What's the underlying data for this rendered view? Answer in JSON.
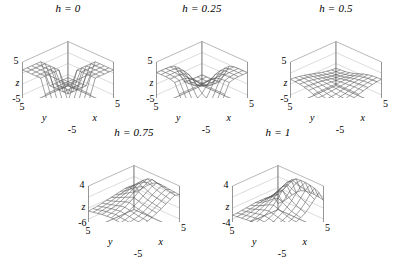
{
  "figure": {
    "type": "multi-panel-3d-surface-grid",
    "layout": "3 panels top row, 2 panels bottom row centered",
    "background_color": "#ffffff",
    "line_color": "#555555",
    "axis_color": "#888888",
    "text_color": "#000000"
  },
  "chart_data": [
    {
      "type": "line",
      "panel_id": "panel-h-0",
      "title": "h = 0",
      "title_parameter": "h",
      "title_value": "0",
      "xlabel": "x",
      "ylabel": "y",
      "zlabel": "z",
      "xlim": [
        -5,
        5
      ],
      "ylim": [
        -5,
        5
      ],
      "zlim": [
        -5,
        5
      ],
      "xticks": [
        "-5",
        "5"
      ],
      "yticks": [
        "-5",
        "5"
      ],
      "zticks": [
        "-5",
        "5"
      ],
      "grid": true,
      "legend": "none",
      "surface_description": "Sharp step discontinuity: two flat plateaus joined by vertical walls forming a cross-shaped jump at x=0 and y=0",
      "mesh_nx": 11,
      "mesh_ny": 11,
      "z_values": [
        [
          -3.2,
          -3.2,
          -3.2,
          -3.2,
          -3.2,
          0.0,
          3.2,
          3.2,
          3.2,
          3.2,
          3.2
        ],
        [
          -3.2,
          -3.2,
          -3.2,
          -3.2,
          -3.2,
          0.0,
          3.2,
          3.2,
          3.2,
          3.2,
          3.2
        ],
        [
          -3.2,
          -3.2,
          -3.2,
          -3.2,
          -3.2,
          0.0,
          3.2,
          3.2,
          3.2,
          3.2,
          3.2
        ],
        [
          -3.2,
          -3.2,
          -3.2,
          -3.2,
          -3.2,
          0.0,
          3.2,
          3.2,
          3.2,
          3.2,
          3.2
        ],
        [
          -3.2,
          -3.2,
          -3.2,
          -3.2,
          -3.2,
          0.0,
          3.2,
          3.2,
          3.2,
          3.2,
          3.2
        ],
        [
          0.0,
          0.0,
          0.0,
          0.0,
          0.0,
          0.0,
          0.0,
          0.0,
          0.0,
          0.0,
          0.0
        ],
        [
          3.2,
          3.2,
          3.2,
          3.2,
          3.2,
          0.0,
          -3.2,
          -3.2,
          -3.2,
          -3.2,
          -3.2
        ],
        [
          3.2,
          3.2,
          3.2,
          3.2,
          3.2,
          0.0,
          -3.2,
          -3.2,
          -3.2,
          -3.2,
          -3.2
        ],
        [
          3.2,
          3.2,
          3.2,
          3.2,
          3.2,
          0.0,
          -3.2,
          -3.2,
          -3.2,
          -3.2,
          -3.2
        ],
        [
          3.2,
          3.2,
          3.2,
          3.2,
          3.2,
          0.0,
          -3.2,
          -3.2,
          -3.2,
          -3.2,
          -3.2
        ],
        [
          3.2,
          3.2,
          3.2,
          3.2,
          3.2,
          0.0,
          -3.2,
          -3.2,
          -3.2,
          -3.2,
          -3.2
        ]
      ]
    },
    {
      "type": "line",
      "panel_id": "panel-h-025",
      "title": "h = 0.25",
      "title_parameter": "h",
      "title_value": "0.25",
      "xlabel": "x",
      "ylabel": "y",
      "zlabel": "z",
      "xlim": [
        -5,
        5
      ],
      "ylim": [
        -5,
        5
      ],
      "zlim": [
        -5,
        5
      ],
      "xticks": [
        "-5",
        "5"
      ],
      "yticks": [
        "-5",
        "5"
      ],
      "zticks": [
        "-5",
        "5"
      ],
      "grid": true,
      "legend": "none",
      "surface_description": "Smoothed saddle: rounded peak at back corner and symmetric dip at front, step edges rounded off",
      "mesh_nx": 11,
      "mesh_ny": 11,
      "z_values": [
        [
          -2.6,
          -2.6,
          -2.6,
          -2.5,
          -2.2,
          0.0,
          2.2,
          2.5,
          2.6,
          2.6,
          2.6
        ],
        [
          -2.6,
          -2.6,
          -2.6,
          -2.5,
          -2.2,
          0.0,
          2.2,
          2.5,
          2.6,
          2.6,
          2.6
        ],
        [
          -2.6,
          -2.6,
          -2.6,
          -2.5,
          -2.1,
          0.0,
          2.1,
          2.5,
          2.6,
          2.6,
          2.6
        ],
        [
          -2.5,
          -2.5,
          -2.5,
          -2.3,
          -1.8,
          0.0,
          1.8,
          2.3,
          2.5,
          2.5,
          2.5
        ],
        [
          -2.2,
          -2.2,
          -2.1,
          -1.8,
          -1.2,
          0.0,
          1.2,
          1.8,
          2.1,
          2.2,
          2.2
        ],
        [
          0.0,
          0.0,
          0.0,
          0.0,
          0.0,
          0.0,
          0.0,
          0.0,
          0.0,
          0.0,
          0.0
        ],
        [
          2.2,
          2.2,
          2.1,
          1.8,
          1.2,
          0.0,
          -1.2,
          -1.8,
          -2.1,
          -2.2,
          -2.2
        ],
        [
          2.5,
          2.5,
          2.5,
          2.3,
          1.8,
          0.0,
          -1.8,
          -2.3,
          -2.5,
          -2.5,
          -2.5
        ],
        [
          2.6,
          2.6,
          2.6,
          2.5,
          2.1,
          0.0,
          -2.1,
          -2.5,
          -2.6,
          -2.6,
          -2.6
        ],
        [
          2.6,
          2.6,
          2.6,
          2.5,
          2.2,
          0.0,
          -2.2,
          -2.5,
          -2.6,
          -2.6,
          -2.6
        ],
        [
          2.6,
          2.6,
          2.6,
          2.5,
          2.2,
          0.0,
          -2.2,
          -2.5,
          -2.6,
          -2.6,
          -2.6
        ]
      ]
    },
    {
      "type": "line",
      "panel_id": "panel-h-05",
      "title": "h = 0.5",
      "title_parameter": "h",
      "title_value": "0.5",
      "xlabel": "x",
      "ylabel": "y",
      "zlabel": "z",
      "xlim": [
        -5,
        5
      ],
      "ylim": [
        -5,
        5
      ],
      "zlim": [
        -5,
        5
      ],
      "xticks": [
        "-5",
        "5"
      ],
      "yticks": [
        "-5",
        "5"
      ],
      "zticks": [
        "-5",
        "5"
      ],
      "grid": true,
      "legend": "none",
      "surface_description": "Nearly planar gently tilted sheet, almost flat with slight saddle curvature",
      "mesh_nx": 11,
      "mesh_ny": 11,
      "z_values": [
        [
          -1.1,
          -1.0,
          -0.8,
          -0.6,
          -0.3,
          0.0,
          0.3,
          0.6,
          0.8,
          1.0,
          1.1
        ],
        [
          -1.0,
          -0.9,
          -0.8,
          -0.6,
          -0.3,
          0.0,
          0.3,
          0.6,
          0.8,
          0.9,
          1.0
        ],
        [
          -0.9,
          -0.8,
          -0.7,
          -0.5,
          -0.3,
          0.0,
          0.3,
          0.5,
          0.7,
          0.8,
          0.9
        ],
        [
          -0.7,
          -0.6,
          -0.5,
          -0.4,
          -0.2,
          0.0,
          0.2,
          0.4,
          0.5,
          0.6,
          0.7
        ],
        [
          -0.4,
          -0.4,
          -0.3,
          -0.2,
          -0.1,
          0.0,
          0.1,
          0.2,
          0.3,
          0.4,
          0.4
        ],
        [
          0.0,
          0.0,
          0.0,
          0.0,
          0.0,
          0.0,
          0.0,
          0.0,
          0.0,
          0.0,
          0.0
        ],
        [
          0.4,
          0.4,
          0.3,
          0.2,
          0.1,
          0.0,
          -0.1,
          -0.2,
          -0.3,
          -0.4,
          -0.4
        ],
        [
          0.7,
          0.6,
          0.5,
          0.4,
          0.2,
          0.0,
          -0.2,
          -0.4,
          -0.5,
          -0.6,
          -0.7
        ],
        [
          0.9,
          0.8,
          0.7,
          0.5,
          0.3,
          0.0,
          -0.3,
          -0.5,
          -0.7,
          -0.8,
          -0.9
        ],
        [
          1.0,
          0.9,
          0.8,
          0.6,
          0.3,
          0.0,
          -0.3,
          -0.6,
          -0.8,
          -0.9,
          -1.0
        ],
        [
          1.1,
          1.0,
          0.8,
          0.6,
          0.3,
          0.0,
          -0.3,
          -0.6,
          -0.8,
          -1.0,
          -1.1
        ]
      ]
    },
    {
      "type": "line",
      "panel_id": "panel-h-075",
      "title": "h = 0.75",
      "title_parameter": "h",
      "title_value": "0.75",
      "xlabel": "x",
      "ylabel": "y",
      "zlabel": "z",
      "xlim": [
        -5,
        5
      ],
      "ylim": [
        -5,
        5
      ],
      "zlim": [
        -6,
        4
      ],
      "xticks": [
        "-5",
        "5"
      ],
      "yticks": [
        "-5",
        "5"
      ],
      "zticks": [
        "-6",
        "4"
      ],
      "grid": true,
      "legend": "none",
      "surface_description": "Broad dome rising toward back corner with a narrow ridge and trough forming along the right-hand edge",
      "mesh_nx": 11,
      "mesh_ny": 11,
      "z_values": [
        [
          -1.4,
          -1.2,
          -1.0,
          -0.7,
          -0.3,
          0.2,
          0.7,
          1.3,
          1.9,
          2.4,
          2.0
        ],
        [
          -1.3,
          -1.1,
          -0.9,
          -0.6,
          -0.2,
          0.3,
          0.9,
          1.5,
          2.1,
          2.6,
          2.1
        ],
        [
          -1.2,
          -1.0,
          -0.8,
          -0.5,
          -0.1,
          0.5,
          1.1,
          1.7,
          2.3,
          2.8,
          2.2
        ],
        [
          -1.1,
          -0.9,
          -0.6,
          -0.3,
          0.1,
          0.7,
          1.3,
          2.0,
          2.6,
          3.0,
          2.3
        ],
        [
          -1.0,
          -0.8,
          -0.5,
          -0.1,
          0.4,
          1.0,
          1.7,
          2.4,
          3.0,
          3.3,
          2.4
        ],
        [
          -0.9,
          -0.6,
          -0.3,
          0.1,
          0.7,
          1.4,
          2.2,
          2.9,
          3.4,
          3.6,
          2.4
        ],
        [
          -1.0,
          -0.8,
          -0.5,
          -0.1,
          0.4,
          1.0,
          1.7,
          2.4,
          3.0,
          3.3,
          1.8
        ],
        [
          -1.1,
          -0.9,
          -0.7,
          -0.4,
          0.0,
          0.5,
          1.1,
          1.7,
          2.2,
          2.5,
          0.9
        ],
        [
          -1.3,
          -1.1,
          -0.9,
          -0.7,
          -0.4,
          0.0,
          0.4,
          0.9,
          1.3,
          1.5,
          -0.2
        ],
        [
          -1.5,
          -1.4,
          -1.2,
          -1.0,
          -0.8,
          -0.5,
          -0.2,
          0.1,
          0.4,
          0.5,
          -1.2
        ],
        [
          -1.7,
          -1.6,
          -1.5,
          -1.3,
          -1.1,
          -0.9,
          -0.7,
          -0.5,
          -0.3,
          -0.3,
          -1.9
        ]
      ]
    },
    {
      "type": "line",
      "panel_id": "panel-h-1",
      "title": "h = 1",
      "title_parameter": "h",
      "title_value": "1",
      "xlabel": "x",
      "ylabel": "y",
      "zlabel": "z",
      "xlim": [
        -5,
        5
      ],
      "ylim": [
        -5,
        5
      ],
      "zlim": [
        -4,
        4
      ],
      "xticks": [
        "-5",
        "5"
      ],
      "yticks": [
        "-5",
        "5"
      ],
      "zticks": [
        "-4",
        "4"
      ],
      "grid": true,
      "legend": "none",
      "surface_description": "Steep peak at back corner with sharp spikes and deep narrow valleys cut along the right edge, flat plain at front",
      "mesh_nx": 11,
      "mesh_ny": 11,
      "z_values": [
        [
          -1.0,
          -0.9,
          -0.8,
          -0.6,
          -0.3,
          0.1,
          0.6,
          1.4,
          2.3,
          3.2,
          1.4
        ],
        [
          -1.0,
          -0.9,
          -0.7,
          -0.5,
          -0.2,
          0.3,
          0.9,
          1.8,
          2.8,
          3.6,
          1.6
        ],
        [
          -1.0,
          -0.8,
          -0.6,
          -0.4,
          0.0,
          0.5,
          1.2,
          2.2,
          3.2,
          3.8,
          1.7
        ],
        [
          -0.9,
          -0.8,
          -0.6,
          -0.2,
          0.3,
          0.9,
          1.7,
          2.7,
          3.5,
          3.9,
          1.7
        ],
        [
          -0.9,
          -0.7,
          -0.4,
          0.0,
          0.6,
          1.4,
          2.3,
          3.2,
          3.8,
          3.9,
          1.6
        ],
        [
          -0.9,
          -0.6,
          -0.3,
          0.2,
          0.9,
          1.8,
          2.8,
          3.6,
          4.0,
          3.8,
          1.3
        ],
        [
          -0.9,
          -0.7,
          -0.4,
          0.0,
          0.6,
          1.3,
          2.1,
          2.8,
          3.2,
          3.0,
          0.6
        ],
        [
          -1.0,
          -0.8,
          -0.6,
          -0.3,
          0.1,
          0.6,
          1.2,
          1.7,
          2.0,
          1.8,
          -0.3
        ],
        [
          -1.1,
          -1.0,
          -0.8,
          -0.6,
          -0.3,
          0.0,
          0.3,
          0.6,
          0.8,
          0.6,
          -1.3
        ],
        [
          -1.2,
          -1.1,
          -1.0,
          -0.9,
          -0.7,
          -0.5,
          -0.4,
          -0.3,
          -0.3,
          -0.5,
          -2.2
        ],
        [
          -1.3,
          -1.3,
          -1.2,
          -1.1,
          -1.0,
          -0.9,
          -0.9,
          -0.9,
          -1.0,
          -1.3,
          -2.9
        ]
      ]
    }
  ]
}
